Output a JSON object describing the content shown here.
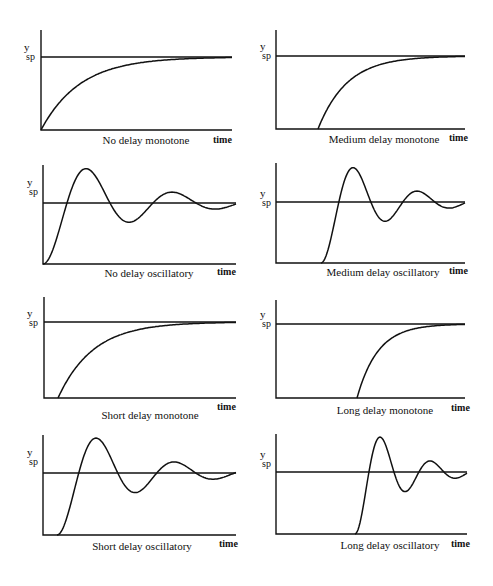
{
  "figure": {
    "width": 493,
    "height": 586,
    "y_label": "y",
    "y_subscript": "sp",
    "x_label": "time"
  },
  "panels": [
    {
      "id": "no-delay-monotone",
      "title": "No delay monotone",
      "type": "monotone",
      "delay": 0.0,
      "ax": 41,
      "top": 30,
      "base": 130,
      "sp": 57,
      "right": 232,
      "start": 41,
      "settle": 205,
      "title_x": 146,
      "title_y": 144,
      "time_x": 213,
      "time_y": 143,
      "ylab_x": 24,
      "ylab_y": 55
    },
    {
      "id": "medium-delay-monotone",
      "title": "Medium delay monotone",
      "type": "monotone",
      "delay": 0.22,
      "ax": 276,
      "top": 30,
      "base": 129,
      "sp": 56,
      "right": 465,
      "start": 318,
      "settle": 440,
      "title_x": 384,
      "title_y": 143,
      "time_x": 449,
      "time_y": 141,
      "ylab_x": 260,
      "ylab_y": 54
    },
    {
      "id": "no-delay-oscillatory",
      "title": "No delay oscillatory",
      "type": "oscillatory",
      "delay": 0.0,
      "ax": 43,
      "top": 165,
      "base": 264,
      "sp": 203,
      "right": 236,
      "start": 43,
      "peak1_x": 86,
      "title_x": 149,
      "title_y": 277,
      "time_x": 217,
      "time_y": 275,
      "ylab_x": 27,
      "ylab_y": 190
    },
    {
      "id": "medium-delay-oscillatory",
      "title": "Medium delay oscillatory",
      "type": "oscillatory",
      "delay": 0.24,
      "ax": 276,
      "top": 163,
      "base": 263,
      "sp": 202,
      "right": 465,
      "start": 321,
      "peak1_x": 353,
      "title_x": 383,
      "title_y": 276,
      "time_x": 449,
      "time_y": 274,
      "ylab_x": 260,
      "ylab_y": 201
    },
    {
      "id": "short-delay-monotone",
      "title": "Short delay monotone",
      "type": "monotone",
      "delay": 0.07,
      "ax": 44,
      "top": 297,
      "base": 398,
      "sp": 322,
      "right": 236,
      "start": 58,
      "settle": 205,
      "title_x": 150,
      "title_y": 419,
      "time_x": 217,
      "time_y": 410,
      "ylab_x": 27,
      "ylab_y": 321
    },
    {
      "id": "long-delay-monotone",
      "title": "Long delay monotone",
      "type": "monotone",
      "delay": 0.43,
      "ax": 276,
      "top": 300,
      "base": 398,
      "sp": 324,
      "right": 465,
      "start": 357,
      "settle": 445,
      "title_x": 385,
      "title_y": 414,
      "time_x": 451,
      "time_y": 411,
      "ylab_x": 260,
      "ylab_y": 322
    },
    {
      "id": "short-delay-oscillatory",
      "title": "Short delay oscillatory",
      "type": "oscillatory",
      "delay": 0.07,
      "ax": 43,
      "top": 435,
      "base": 535,
      "sp": 473,
      "right": 236,
      "start": 57,
      "peak1_x": 96,
      "title_x": 142,
      "title_y": 550,
      "time_x": 219,
      "time_y": 547,
      "ylab_x": 27,
      "ylab_y": 460
    },
    {
      "id": "long-delay-oscillatory",
      "title": "Long delay oscillatory",
      "type": "oscillatory",
      "delay": 0.42,
      "ax": 276,
      "top": 434,
      "base": 534,
      "sp": 472,
      "right": 467,
      "start": 355,
      "peak1_x": 380,
      "title_x": 390,
      "title_y": 549,
      "time_x": 451,
      "time_y": 547,
      "ylab_x": 260,
      "ylab_y": 462
    }
  ]
}
